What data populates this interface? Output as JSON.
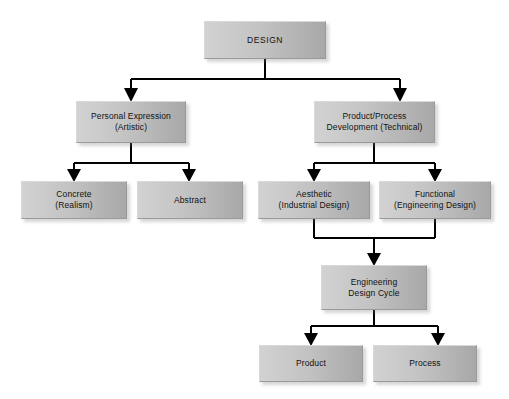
{
  "diagram": {
    "background_color": "#ffffff",
    "node_fill_light": "#d2d2d2",
    "node_fill_dark": "#a8a8a8",
    "connector_color": "#000000",
    "nodes": {
      "design": "DESIGN",
      "personal_expression": "Personal Expression\n(Artistic)",
      "product_process": "Product/Process\nDevelopment (Technical)",
      "concrete": "Concrete\n(Realism)",
      "abstract": "Abstract",
      "aesthetic": "Aesthetic\n(Industrial Design)",
      "functional": "Functional\n(Engineering Design)",
      "engineering_design_cycle": "Engineering\nDesign Cycle",
      "product": "Product",
      "process": "Process"
    }
  }
}
